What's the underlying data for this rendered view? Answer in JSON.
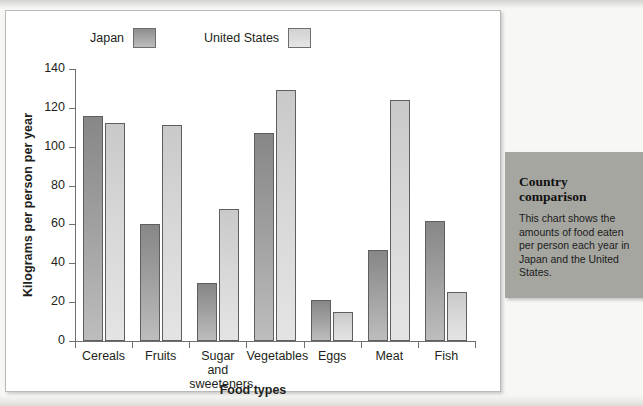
{
  "panel": {
    "title": "Country comparison",
    "body": "This chart shows the amounts of food eaten per person each year in Japan and the United States."
  },
  "colors": {
    "japan": "#9e9e9e",
    "united_states": "#d7d7d7",
    "axis": "#6f6f6f",
    "panel_bg": "#a6a6a1",
    "card_bg": "#ffffff",
    "text": "#231f20"
  },
  "chart_data": {
    "type": "bar",
    "title": "",
    "xlabel": "Food types",
    "ylabel": "Kilograms per person per year",
    "ylim": [
      0,
      140
    ],
    "yticks": [
      0,
      20,
      40,
      60,
      80,
      100,
      120,
      140
    ],
    "ytick_labels": [
      "0",
      "20",
      "40",
      "60",
      "80",
      "100",
      "120",
      "140"
    ],
    "grid": false,
    "legend_position": "top",
    "categories": [
      "Cereals",
      "Fruits",
      "Sugar and sweeteners",
      "Vegetables",
      "Eggs",
      "Meat",
      "Fish"
    ],
    "category_labels": [
      [
        "Cereals"
      ],
      [
        "Fruits"
      ],
      [
        "Sugar and",
        "sweeteners"
      ],
      [
        "Vegetables"
      ],
      [
        "Eggs"
      ],
      [
        "Meat"
      ],
      [
        "Fish"
      ]
    ],
    "series": [
      {
        "name": "Japan",
        "color": "#9e9e9e",
        "values": [
          116,
          60,
          30,
          107,
          21,
          47,
          62
        ]
      },
      {
        "name": "United States",
        "color": "#d7d7d7",
        "values": [
          112,
          111,
          68,
          129,
          15,
          124,
          25
        ]
      }
    ]
  }
}
